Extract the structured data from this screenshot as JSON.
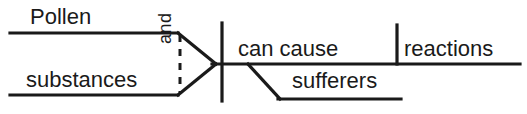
{
  "diagram": {
    "type": "reed-kellogg-sentence-diagram",
    "sentence": "Pollen and substances can cause reactions sufferers",
    "stroke_color": "#1a1a1a",
    "background_color": "#ffffff",
    "labels": {
      "subject_upper": "Pollen",
      "subject_lower": "substances",
      "conjunction": "and",
      "verb": "can cause",
      "direct_object": "reactions",
      "modifier": "sufferers"
    }
  }
}
